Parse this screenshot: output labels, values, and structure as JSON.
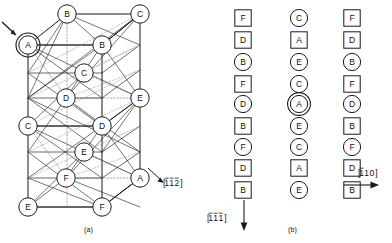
{
  "figure": {
    "panel_a": {
      "caption": "(a)",
      "direction_label": "[112]",
      "direction_label_parts": {
        "h": "1",
        "k": "1",
        "l": "2",
        "bars": [
          true,
          true,
          true
        ]
      },
      "highlighted_atom": "A",
      "atoms": [
        {
          "label": "B",
          "x": 67,
          "y": 14,
          "kind": "circle"
        },
        {
          "label": "C",
          "x": 140,
          "y": 14,
          "kind": "circle"
        },
        {
          "label": "A",
          "x": 28,
          "y": 45,
          "kind": "double-circle"
        },
        {
          "label": "B",
          "x": 102,
          "y": 45,
          "kind": "circle"
        },
        {
          "label": "C",
          "x": 84,
          "y": 73,
          "kind": "circle"
        },
        {
          "label": "D",
          "x": 66,
          "y": 98,
          "kind": "circle"
        },
        {
          "label": "E",
          "x": 140,
          "y": 98,
          "kind": "circle"
        },
        {
          "label": "C",
          "x": 28,
          "y": 126,
          "kind": "circle"
        },
        {
          "label": "D",
          "x": 102,
          "y": 126,
          "kind": "circle"
        },
        {
          "label": "E",
          "x": 84,
          "y": 152,
          "kind": "circle"
        },
        {
          "label": "F",
          "x": 66,
          "y": 178,
          "kind": "circle"
        },
        {
          "label": "A",
          "x": 140,
          "y": 178,
          "kind": "circle"
        },
        {
          "label": "E",
          "x": 28,
          "y": 207,
          "kind": "circle"
        },
        {
          "label": "F",
          "x": 102,
          "y": 207,
          "kind": "circle"
        }
      ]
    },
    "panel_b": {
      "caption": "(b)",
      "direction_label_vertical": "[111]",
      "direction_label_vertical_parts": {
        "h": "1",
        "k": "1",
        "l": "1",
        "bars": [
          true,
          true,
          true
        ]
      },
      "direction_label_horizontal": "[110]",
      "direction_label_horizontal_parts": {
        "h": "1",
        "k": "1",
        "l": "0",
        "bars": [
          true,
          false,
          false
        ]
      },
      "highlighted_atom": "A",
      "columns": [
        {
          "name": "column-left",
          "x": 243,
          "items": [
            {
              "label": "F",
              "kind": "square"
            },
            {
              "label": "D",
              "kind": "square"
            },
            {
              "label": "B",
              "kind": "circle"
            },
            {
              "label": "F",
              "kind": "square"
            },
            {
              "label": "D",
              "kind": "circle"
            },
            {
              "label": "B",
              "kind": "square"
            },
            {
              "label": "F",
              "kind": "circle"
            },
            {
              "label": "D",
              "kind": "square"
            },
            {
              "label": "B",
              "kind": "square"
            }
          ]
        },
        {
          "name": "column-middle",
          "x": 299,
          "items": [
            {
              "label": "C",
              "kind": "circle"
            },
            {
              "label": "A",
              "kind": "square"
            },
            {
              "label": "E",
              "kind": "circle"
            },
            {
              "label": "C",
              "kind": "circle"
            },
            {
              "label": "A",
              "kind": "double-circle"
            },
            {
              "label": "E",
              "kind": "circle"
            },
            {
              "label": "C",
              "kind": "circle"
            },
            {
              "label": "A",
              "kind": "square"
            },
            {
              "label": "E",
              "kind": "circle"
            }
          ]
        },
        {
          "name": "column-right",
          "x": 352,
          "items": [
            {
              "label": "F",
              "kind": "square"
            },
            {
              "label": "D",
              "kind": "square"
            },
            {
              "label": "B",
              "kind": "circle"
            },
            {
              "label": "F",
              "kind": "square"
            },
            {
              "label": "D",
              "kind": "circle"
            },
            {
              "label": "B",
              "kind": "square"
            },
            {
              "label": "F",
              "kind": "circle"
            },
            {
              "label": "D",
              "kind": "square"
            },
            {
              "label": "B",
              "kind": "square"
            }
          ]
        }
      ],
      "row_y": [
        18,
        40,
        62,
        84,
        104,
        126,
        147,
        168,
        190
      ]
    },
    "colors": {
      "line": "#1a1a1a",
      "dashed": "#9a9a9a",
      "text": "#111111",
      "background": "#ffffff"
    }
  }
}
